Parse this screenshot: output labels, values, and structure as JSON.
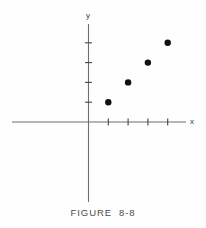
{
  "figure": {
    "caption": "FIGURE  8-8",
    "axis_labels": {
      "x": "x",
      "y": "y"
    },
    "colors": {
      "axis": "#6e6e6e",
      "tick": "#444444",
      "point": "#111111",
      "caption_text": "#4a4a4a",
      "background": "#fefefe"
    }
  },
  "chart_data": {
    "type": "scatter",
    "title": "FIGURE  8-8",
    "xlabel": "x",
    "ylabel": "y",
    "x": [
      1,
      2,
      3,
      4
    ],
    "y": [
      1,
      2,
      3,
      4
    ],
    "series": [
      {
        "name": "data",
        "points": [
          {
            "x": 1,
            "y": 1
          },
          {
            "x": 2,
            "y": 2
          },
          {
            "x": 3,
            "y": 3
          },
          {
            "x": 4,
            "y": 4
          }
        ]
      }
    ],
    "xlim": [
      -4,
      5.5
    ],
    "ylim": [
      -4.2,
      4.5
    ],
    "xticks": [
      1,
      2,
      3,
      4
    ],
    "yticks": [
      1,
      2,
      3,
      4
    ],
    "xticklabels": [
      "",
      "",
      "",
      ""
    ],
    "yticklabels": [
      "",
      "",
      "",
      ""
    ],
    "grid": false,
    "legend": false,
    "annotations": []
  },
  "geometry": {
    "origin": {
      "x": 88.5,
      "y": 122
    },
    "unit_px": 19.8,
    "x_axis": {
      "start": 12,
      "end": 186
    },
    "y_axis": {
      "start": 24,
      "end": 202
    },
    "point_radius": 3.2,
    "tick_half_len": 3.5
  }
}
